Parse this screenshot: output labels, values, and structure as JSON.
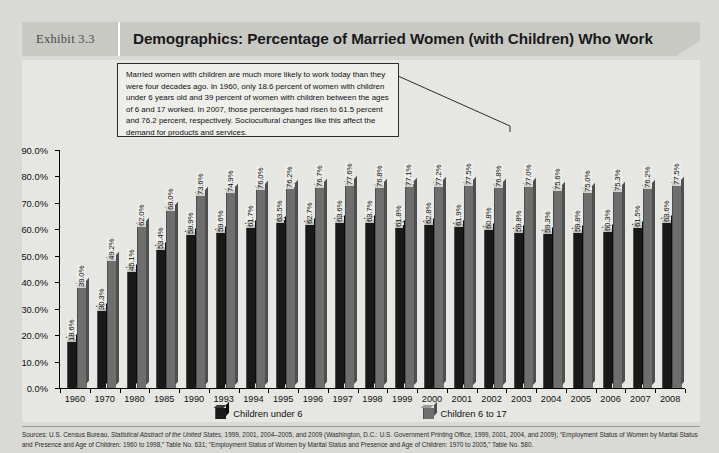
{
  "header": {
    "exhibit_tag": "Exhibit 3.3",
    "title": "Demographics: Percentage of Married Women (with Children) Who Work"
  },
  "callout": {
    "text": "Married women with children are much more likely to work today than they were four decades ago. In 1960, only 18.6 percent of women with children under 6 years old and 39 percent of women with children between the ages of 6 and 17 worked. In 2007, those percentages had risen to 61.5 percent and 76.2 percent, respectively. Sociocultural changes like this affect the demand for products and services."
  },
  "legend": {
    "items": [
      {
        "label": "Children under 6",
        "swatch": "dark-cube-icon"
      },
      {
        "label": "Children 6 to 17",
        "swatch": "light-cube-icon"
      }
    ]
  },
  "source": {
    "line1_a": "Sources: U.S. Census Bureau, ",
    "line1_i": "Statistical Abstract of the United States,",
    "line1_b": " 1999, 2001, 2004–2005, and 2009 (Washington, D.C.: U.S. Government Printing Office, 1999, 2001, 2004, and 2009); “Employment Status of",
    "line2": "Women by Marital Status and Presence and Age of Children: 1960 to 1998,” Table No. 631; “Employment Status of Women by Marital Status and Presence and Age of Children: 1970 to 2005,” Table No. 580."
  },
  "chart_data": {
    "type": "bar",
    "title": "Demographics: Percentage of Married Women (with Children) Who Work",
    "xlabel": "",
    "ylabel": "",
    "ylim": [
      0,
      90
    ],
    "ytick_labels": [
      "90.0%",
      "80.0%",
      "70.0%",
      "60.0%",
      "50.0%",
      "40.0%",
      "30.0%",
      "20.0%",
      "10.0%",
      "0.0%"
    ],
    "ytick_values": [
      90,
      80,
      70,
      60,
      50,
      40,
      30,
      20,
      10,
      0
    ],
    "grid": false,
    "legend_position": "bottom",
    "categories": [
      "1960",
      "1970",
      "1980",
      "1985",
      "1990",
      "1993",
      "1994",
      "1995",
      "1996",
      "1997",
      "1998",
      "1999",
      "2000",
      "2001",
      "2002",
      "2003",
      "2004",
      "2005",
      "2006",
      "2007",
      "2008"
    ],
    "series": [
      {
        "name": "Children under 6",
        "color": "#191919",
        "values": [
          18.6,
          30.3,
          45.1,
          53.4,
          58.9,
          59.6,
          61.7,
          63.5,
          62.7,
          63.6,
          63.7,
          61.8,
          62.8,
          61.9,
          60.8,
          59.8,
          59.3,
          59.8,
          60.3,
          61.5,
          63.6
        ],
        "labels": [
          "18.6%",
          "30.3%",
          "45.1%",
          "53.4%",
          "58.9%",
          "59.6%",
          "61.7%",
          "63.5%",
          "62.7%",
          "63.6%",
          "63.7%",
          "61.8%",
          "62.8%",
          "61.9%",
          "60.8%",
          "59.8%",
          "59.3%",
          "59.8%",
          "60.3%",
          "61.5%",
          "63.6%"
        ]
      },
      {
        "name": "Children 6 to 17",
        "color": "#6e6e6e",
        "values": [
          39.0,
          49.2,
          62.0,
          68.0,
          73.6,
          74.9,
          76.0,
          76.2,
          76.7,
          77.6,
          76.8,
          77.1,
          77.2,
          77.5,
          76.8,
          77.0,
          75.6,
          75.0,
          75.3,
          76.2,
          77.5
        ],
        "labels": [
          "39.0%",
          "49.2%",
          "62.0%",
          "68.0%",
          "73.6%",
          "74.9%",
          "76.0%",
          "76.2%",
          "76.7%",
          "77.6%",
          "76.8%",
          "77.1%",
          "77.2%",
          "77.5%",
          "76.8%",
          "77.0%",
          "75.6%",
          "75.0%",
          "75.3%",
          "76.2%",
          "77.5%"
        ]
      }
    ]
  }
}
